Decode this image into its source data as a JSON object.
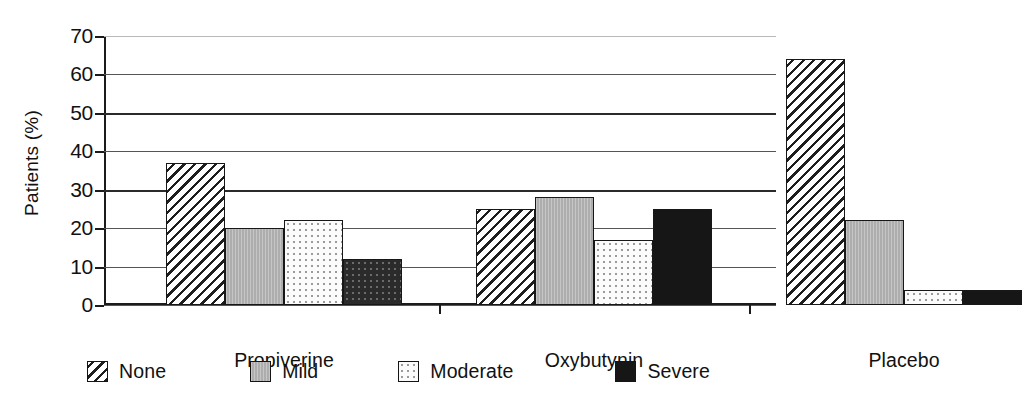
{
  "chart_data": {
    "type": "bar",
    "title": "",
    "subtitle": "",
    "xlabel": "",
    "ylabel": "Patients (%)",
    "categories": [
      "Propiverine",
      "Oxybutynin",
      "Placebo"
    ],
    "series": [
      {
        "name": "None",
        "values": [
          37,
          25,
          64
        ],
        "fill": "diagonal-hatch",
        "color": "#ffffff"
      },
      {
        "name": "Mild",
        "values": [
          20,
          28,
          22
        ],
        "fill": "solid-gray",
        "color": "#adadad"
      },
      {
        "name": "Moderate",
        "values": [
          22,
          17,
          4
        ],
        "fill": "light-dotted",
        "color": "#fbfbfb"
      },
      {
        "name": "Severe",
        "values": [
          12,
          25,
          4
        ],
        "fill": "solid-black",
        "color": "#161616"
      }
    ],
    "ylim": [
      0,
      70
    ],
    "yticks": [
      0,
      10,
      20,
      30,
      40,
      50,
      60,
      70
    ],
    "ytick_labels": [
      "0",
      "10",
      "20",
      "30",
      "40",
      "50",
      "60",
      "70"
    ],
    "grid": true,
    "grid_axis": "y",
    "legend_position": "bottom",
    "legend_entries": [
      "None",
      "Mild",
      "Moderate",
      "Severe"
    ]
  },
  "axis": {
    "y_title": "Patients (%)",
    "ticks": [
      {
        "value": 70,
        "label": "70"
      },
      {
        "value": 60,
        "label": "60"
      },
      {
        "value": 50,
        "label": "50"
      },
      {
        "value": 40,
        "label": "40"
      },
      {
        "value": 30,
        "label": "30"
      },
      {
        "value": 20,
        "label": "20"
      },
      {
        "value": 10,
        "label": "10"
      },
      {
        "value": 0,
        "label": "0"
      }
    ]
  },
  "groups": [
    {
      "label": "Propiverine",
      "bars": [
        {
          "series": "None",
          "value": 37
        },
        {
          "series": "Mild",
          "value": 20
        },
        {
          "series": "Moderate",
          "value": 22
        },
        {
          "series": "Severe",
          "value": 12
        }
      ]
    },
    {
      "label": "Oxybutynin",
      "bars": [
        {
          "series": "None",
          "value": 25
        },
        {
          "series": "Mild",
          "value": 28
        },
        {
          "series": "Moderate",
          "value": 17
        },
        {
          "series": "Severe",
          "value": 25
        }
      ]
    },
    {
      "label": "Placebo",
      "bars": [
        {
          "series": "None",
          "value": 64
        },
        {
          "series": "Mild",
          "value": 22
        },
        {
          "series": "Moderate",
          "value": 4
        },
        {
          "series": "Severe",
          "value": 4
        }
      ]
    }
  ],
  "legend": {
    "items": [
      {
        "label": "None",
        "swatch": "diagonal-hatch-swatch"
      },
      {
        "label": "Mild",
        "swatch": "gray-swatch"
      },
      {
        "label": "Moderate",
        "swatch": "white-dotted-swatch"
      },
      {
        "label": "Severe",
        "swatch": "black-swatch"
      }
    ]
  },
  "colors": {
    "axis": "#1b1b1b",
    "gridline": "#555555",
    "bar_outline": "#171717",
    "mild_gray": "#adadad",
    "severe_black": "#161616",
    "background": "#ffffff"
  }
}
